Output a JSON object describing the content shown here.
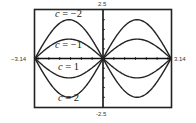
{
  "chart_data": {
    "type": "line",
    "title": "",
    "xlabel": "",
    "ylabel": "",
    "function": "y = -c sin(x)",
    "xlim": [
      -3.14,
      3.14
    ],
    "ylim": [
      -2.5,
      2.5
    ],
    "x_tick_step": 0.5,
    "y_tick_step": 0.5,
    "grid": false,
    "legend": "inline labels",
    "tick_labels": {
      "x_min": "-3.14",
      "x_max": "3.14",
      "y_max": "2.5",
      "y_min": "-2.5"
    },
    "series": [
      {
        "name": "c = -2",
        "c": -2,
        "label": "c = −2",
        "amplitude_left": 2
      },
      {
        "name": "c = -1",
        "c": -1,
        "label": "c = −1",
        "amplitude_left": 1
      },
      {
        "name": "c = 1",
        "c": 1,
        "label": "c = 1",
        "amplitude_left": -1
      },
      {
        "name": "c = 2",
        "c": 2,
        "label": "c = 2",
        "amplitude_left": -2
      }
    ],
    "colors": {
      "curve": "#222222",
      "frame": "#222222",
      "axis": "#111111"
    }
  },
  "labels": {
    "y_top": "2.5",
    "y_bottom": "-2.5",
    "x_left": "−3.14",
    "x_right": "3.14",
    "c_neg2": {
      "var": "c",
      "rest": " = −2"
    },
    "c_neg1": {
      "var": "c",
      "rest": " = −1"
    },
    "c_pos1": {
      "var": "c",
      "rest": " = 1"
    },
    "c_pos2": {
      "var": "c",
      "rest": " = 2"
    }
  }
}
